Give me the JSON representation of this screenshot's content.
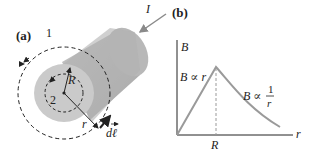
{
  "panel_a": {
    "label": "(a)",
    "loop_outer_label": "1",
    "loop_inner_label": "2",
    "radius_label": "R",
    "r_label": "r",
    "dl_label": "dℓ",
    "current_label": "I"
  },
  "panel_b": {
    "label": "(b)",
    "y_axis_label": "B",
    "x_axis_label": "r",
    "x_tick_label": "R",
    "inside_label": "B ∝ r",
    "outside_label_prefix": "B ∝",
    "outside_frac_num": "1",
    "outside_frac_den": "r"
  },
  "colors": {
    "cylinder_face": "#c8c8c8",
    "cylinder_body": "#b4b4b4",
    "curve": "#9a9a9a",
    "text": "#222222"
  }
}
